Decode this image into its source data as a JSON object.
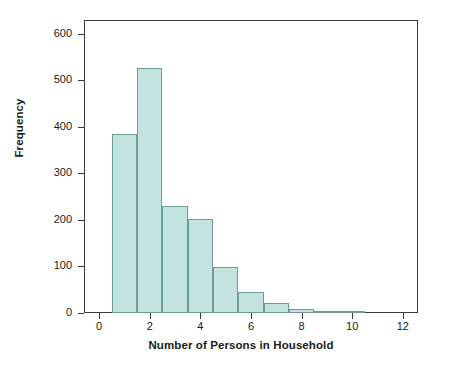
{
  "chart_data": {
    "type": "bar",
    "title": "",
    "xlabel": "Number of Persons in Household",
    "ylabel": "Frequency",
    "grid": false,
    "legend": false,
    "xlim": [
      -0.6,
      12.6
    ],
    "ylim": [
      0,
      630
    ],
    "xticks": [
      0,
      2,
      4,
      6,
      8,
      10,
      12
    ],
    "xtick_labels": [
      "0",
      "2",
      "4",
      "6",
      "8",
      "10",
      "12"
    ],
    "yticks": [
      0,
      100,
      200,
      300,
      400,
      500,
      600
    ],
    "ytick_labels": [
      "0",
      "100",
      "200",
      "300",
      "400",
      "500",
      "600"
    ],
    "bin_width": 1,
    "bins": [
      {
        "label": "1",
        "left": 0.5,
        "right": 1.5,
        "value": 384
      },
      {
        "label": "2",
        "left": 1.5,
        "right": 2.5,
        "value": 527
      },
      {
        "label": "3",
        "left": 2.5,
        "right": 3.5,
        "value": 230
      },
      {
        "label": "4",
        "left": 3.5,
        "right": 4.5,
        "value": 202
      },
      {
        "label": "5",
        "left": 4.5,
        "right": 5.5,
        "value": 100
      },
      {
        "label": "6",
        "left": 5.5,
        "right": 6.5,
        "value": 46
      },
      {
        "label": "7",
        "left": 6.5,
        "right": 7.5,
        "value": 22
      },
      {
        "label": "8",
        "left": 7.5,
        "right": 8.5,
        "value": 9
      },
      {
        "label": "9",
        "left": 8.5,
        "right": 9.5,
        "value": 5
      },
      {
        "label": "10",
        "left": 9.5,
        "right": 10.5,
        "value": 5
      }
    ],
    "categories": [
      "1",
      "2",
      "3",
      "4",
      "5",
      "6",
      "7",
      "8",
      "9",
      "10"
    ],
    "values": [
      384,
      527,
      230,
      202,
      100,
      46,
      22,
      9,
      5,
      5
    ],
    "colors": {
      "bar_fill": "#c3e3de",
      "bar_border": "#6f9c97",
      "axis": "#3a3a3a",
      "text": "#1a1a1a",
      "background": "#ffffff"
    }
  }
}
